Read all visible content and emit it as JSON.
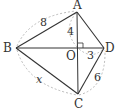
{
  "diagram": {
    "type": "geometry",
    "colors": {
      "line": "#333333",
      "dashed": "#aaaaaa",
      "text": "#333333"
    },
    "vertices": {
      "A": {
        "label": "A",
        "x": 77,
        "y": 12
      },
      "B": {
        "label": "B",
        "x": 16,
        "y": 48
      },
      "C": {
        "label": "C",
        "x": 78,
        "y": 94
      },
      "D": {
        "label": "D",
        "x": 104,
        "y": 48
      },
      "O": {
        "label": "O",
        "x": 78,
        "y": 48
      }
    },
    "segments": [
      {
        "from": "A",
        "to": "B",
        "style": "solid"
      },
      {
        "from": "A",
        "to": "D",
        "style": "solid"
      },
      {
        "from": "B",
        "to": "C",
        "style": "solid"
      },
      {
        "from": "C",
        "to": "D",
        "style": "solid"
      },
      {
        "from": "A",
        "to": "C",
        "style": "solid"
      },
      {
        "from": "B",
        "to": "D",
        "style": "solid"
      }
    ],
    "measurements": {
      "AB": "8",
      "BC": "x",
      "CD": "6",
      "AO": "4",
      "OD": "3"
    },
    "right_angle_at": "O"
  }
}
